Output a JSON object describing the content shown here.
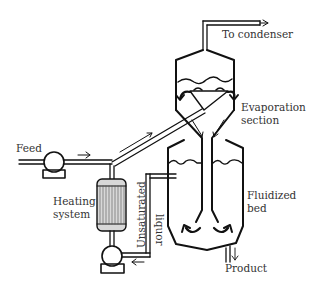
{
  "diagram": {
    "labels": {
      "to_condenser": "To condenser",
      "evaporation_line1": "Evaporation",
      "evaporation_line2": "section",
      "feed": "Feed",
      "heating_line1": "Heating",
      "heating_line2": "system",
      "unsaturated": "Unsaturated",
      "liquor": "liquor",
      "fluidized_line1": "Fluidized",
      "fluidized_line2": "bed",
      "product": "Product"
    },
    "colors": {
      "line": "#111111",
      "text": "#333333",
      "heater_fill": "#d8d8d8",
      "background": "#ffffff"
    }
  }
}
